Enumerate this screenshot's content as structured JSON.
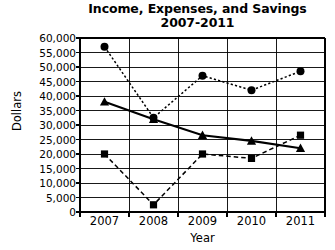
{
  "chart_data": {
    "type": "line",
    "title": "Income, Expenses, and Savings 2007-2011",
    "title_line1": "Income, Expenses, and Savings",
    "title_line2": "2007-2011",
    "xlabel": "Year",
    "ylabel": "Dollars",
    "categories": [
      "2007",
      "2008",
      "2009",
      "2010",
      "2011"
    ],
    "ylim": [
      0,
      60000
    ],
    "ytick_step": 5000,
    "ytick_labels": [
      "60,000",
      "55,000",
      "50,000",
      "45,000",
      "40,000",
      "35,000",
      "30,000",
      "25,000",
      "20,000",
      "15,000",
      "10,000",
      "5,000",
      "0"
    ],
    "ytick_values": [
      60000,
      55000,
      50000,
      45000,
      40000,
      35000,
      30000,
      25000,
      20000,
      15000,
      10000,
      5000,
      0
    ],
    "grid": true,
    "grid_axis": "y-and-x",
    "legend": null,
    "legend_position": "none",
    "series": [
      {
        "name": "Income",
        "marker": "circle",
        "line_style": "dotted",
        "color": "#000000",
        "values": [
          57000,
          32500,
          47000,
          42000,
          48500
        ]
      },
      {
        "name": "Expenses",
        "marker": "triangle",
        "line_style": "solid",
        "color": "#000000",
        "values": [
          38000,
          32000,
          26500,
          24500,
          22000
        ]
      },
      {
        "name": "Savings",
        "marker": "square",
        "line_style": "dashed",
        "color": "#000000",
        "values": [
          20000,
          2500,
          20000,
          18500,
          26500
        ]
      }
    ]
  }
}
